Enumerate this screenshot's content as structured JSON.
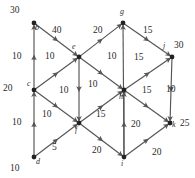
{
  "diagram": {
    "type": "directed-network-flow-graph",
    "edge_color": "#555555",
    "node_color": "#222222",
    "text_color": "#2b2b2b",
    "nodes": [
      {
        "id": "b",
        "label": "b",
        "x": 34,
        "y": 23,
        "lx": 35,
        "ly": 24,
        "supply": "30",
        "sx": 10,
        "sy": 6
      },
      {
        "id": "g",
        "label": "g",
        "x": 123,
        "y": 23,
        "lx": 120,
        "ly": 8,
        "supply": "",
        "sx": 0,
        "sy": 0
      },
      {
        "id": "e",
        "label": "e",
        "x": 79,
        "y": 57,
        "lx": 72,
        "ly": 43,
        "supply": "",
        "sx": 0,
        "sy": 0
      },
      {
        "id": "j",
        "label": "j",
        "x": 172,
        "y": 57,
        "lx": 163,
        "ly": 42,
        "supply": "30",
        "sx": 174,
        "sy": 41
      },
      {
        "id": "c",
        "label": "c",
        "x": 34,
        "y": 90,
        "lx": 27,
        "ly": 80,
        "supply": "20",
        "sx": 3,
        "sy": 84
      },
      {
        "id": "h",
        "label": "h",
        "x": 124,
        "y": 90,
        "lx": 119,
        "ly": 93,
        "supply": "",
        "sx": 0,
        "sy": 0
      },
      {
        "id": "f",
        "label": "f",
        "x": 79,
        "y": 123,
        "lx": 75,
        "ly": 126,
        "supply": "",
        "sx": 0,
        "sy": 0
      },
      {
        "id": "k",
        "label": "k",
        "x": 170,
        "y": 123,
        "lx": 172,
        "ly": 121,
        "supply": "25",
        "sx": 180,
        "sy": 119
      },
      {
        "id": "d",
        "label": "d",
        "x": 34,
        "y": 157,
        "lx": 36,
        "ly": 158,
        "supply": "10",
        "sx": 10,
        "sy": 164
      },
      {
        "id": "i",
        "label": "i",
        "x": 124,
        "y": 157,
        "lx": 121,
        "ly": 160,
        "supply": "",
        "sx": 0,
        "sy": 0
      }
    ],
    "edges": [
      {
        "from": "c",
        "to": "b",
        "weight": "10",
        "wx": 12,
        "wy": 52
      },
      {
        "from": "b",
        "to": "e",
        "weight": "40",
        "wx": 52,
        "wy": 26
      },
      {
        "from": "e",
        "to": "g",
        "weight": "20",
        "wx": 93,
        "wy": 26
      },
      {
        "from": "g",
        "to": "j",
        "weight": "15",
        "wx": 143,
        "wy": 26
      },
      {
        "from": "c",
        "to": "e",
        "weight": "10",
        "wx": 45,
        "wy": 52
      },
      {
        "from": "e",
        "to": "f",
        "weight": "10",
        "wx": 59,
        "wy": 86
      },
      {
        "from": "e",
        "to": "h",
        "weight": "10",
        "wx": 88,
        "wy": 80
      },
      {
        "from": "i",
        "to": "g",
        "weight": "10",
        "wx": 107,
        "wy": 52
      },
      {
        "from": "h",
        "to": "j",
        "weight": "15",
        "wx": 134,
        "wy": 53
      },
      {
        "from": "j",
        "to": "k",
        "weight": "10",
        "wx": 166,
        "wy": 85
      },
      {
        "from": "h",
        "to": "k",
        "weight": "15",
        "wx": 142,
        "wy": 86
      },
      {
        "from": "c",
        "to": "f",
        "weight": "10",
        "wx": 42,
        "wy": 110
      },
      {
        "from": "f",
        "to": "h",
        "weight": "15",
        "wx": 96,
        "wy": 110
      },
      {
        "from": "d",
        "to": "c",
        "weight": "10",
        "wx": 12,
        "wy": 118
      },
      {
        "from": "d",
        "to": "f",
        "weight": "5",
        "wx": 52,
        "wy": 143
      },
      {
        "from": "f",
        "to": "i",
        "weight": "20",
        "wx": 92,
        "wy": 146
      },
      {
        "from": "i",
        "to": "h",
        "weight": "20",
        "wx": 131,
        "wy": 120
      },
      {
        "from": "i",
        "to": "k",
        "weight": "20",
        "wx": 152,
        "wy": 148
      }
    ]
  }
}
